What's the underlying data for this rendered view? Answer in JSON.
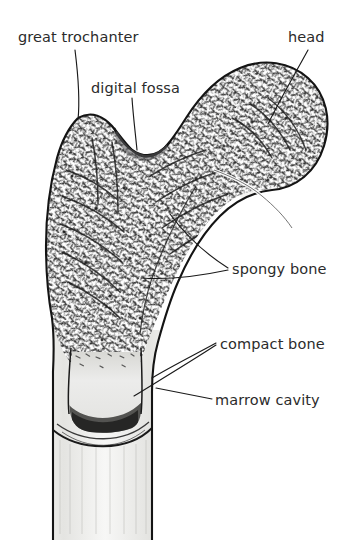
{
  "figure": {
    "background_color": "#ffffff",
    "ink_color": "#1a1a1a",
    "label_color": "#2b2b2b"
  },
  "labels": [
    {
      "id": "great-trochanter",
      "text": "great trochanter"
    },
    {
      "id": "head",
      "text": "head"
    },
    {
      "id": "digital-fossa",
      "text": "digital fossa"
    },
    {
      "id": "spongy-bone",
      "text": "spongy bone"
    },
    {
      "id": "compact-bone",
      "text": "compact bone"
    },
    {
      "id": "marrow-cavity",
      "text": "marrow cavity"
    }
  ]
}
